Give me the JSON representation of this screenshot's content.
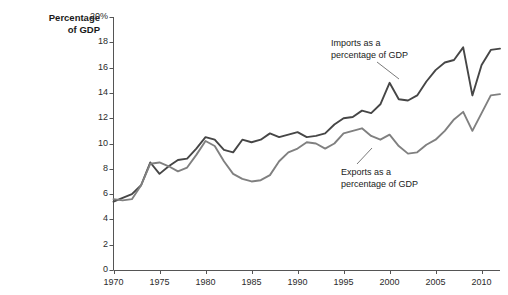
{
  "chart_data": {
    "type": "line",
    "title": "",
    "ylabel": "Percentage of GDP",
    "xlabel": "",
    "ylabel_line1": "Percentage",
    "ylabel_line2": "of GDP",
    "xlim": [
      1970,
      2012
    ],
    "ylim": [
      0,
      20
    ],
    "grid": false,
    "legend_position": "inline-annotations",
    "ytick_labels": [
      "20%",
      "18",
      "16",
      "14",
      "12",
      "10",
      "8",
      "6",
      "4",
      "2",
      "0"
    ],
    "ytick_values": [
      20,
      18,
      16,
      14,
      12,
      10,
      8,
      6,
      4,
      2,
      0
    ],
    "xtick_labels": [
      "1970",
      "1975",
      "1980",
      "1985",
      "1990",
      "1995",
      "2000",
      "2005",
      "2010"
    ],
    "xtick_values": [
      1970,
      1975,
      1980,
      1985,
      1990,
      1995,
      2000,
      2005,
      2010
    ],
    "x": [
      1970,
      1971,
      1972,
      1973,
      1974,
      1975,
      1976,
      1977,
      1978,
      1979,
      1980,
      1981,
      1982,
      1983,
      1984,
      1985,
      1986,
      1987,
      1988,
      1989,
      1990,
      1991,
      1992,
      1993,
      1994,
      1995,
      1996,
      1997,
      1998,
      1999,
      2000,
      2001,
      2002,
      2003,
      2004,
      2005,
      2006,
      2007,
      2008,
      2009,
      2010,
      2011,
      2012
    ],
    "series": [
      {
        "name": "Imports as a percentage of GDP",
        "color": "#464646",
        "annotation": "Imports as a\npercentage of GDP",
        "annotation_line1": "Imports as a",
        "annotation_line2": "percentage of GDP",
        "values": [
          5.4,
          5.7,
          6.0,
          6.7,
          8.5,
          7.6,
          8.2,
          8.7,
          8.8,
          9.6,
          10.5,
          10.3,
          9.5,
          9.3,
          10.3,
          10.1,
          10.3,
          10.8,
          10.5,
          10.7,
          10.9,
          10.5,
          10.6,
          10.8,
          11.5,
          12.0,
          12.1,
          12.6,
          12.4,
          13.1,
          14.8,
          13.5,
          13.4,
          13.8,
          14.9,
          15.8,
          16.4,
          16.6,
          17.6,
          13.8,
          16.2,
          17.4,
          17.5
        ]
      },
      {
        "name": "Exports as a percentage of GDP",
        "color": "#808080",
        "annotation": "Exports as a\npercentage of GDP",
        "annotation_line1": "Exports as a",
        "annotation_line2": "percentage of GDP",
        "values": [
          5.6,
          5.5,
          5.6,
          6.7,
          8.4,
          8.5,
          8.2,
          7.8,
          8.1,
          9.1,
          10.2,
          9.8,
          8.6,
          7.6,
          7.2,
          7.0,
          7.1,
          7.5,
          8.6,
          9.3,
          9.6,
          10.1,
          10.0,
          9.6,
          10.0,
          10.8,
          11.0,
          11.2,
          10.6,
          10.3,
          10.7,
          9.8,
          9.2,
          9.3,
          9.9,
          10.3,
          11.0,
          11.9,
          12.5,
          11.0,
          12.4,
          13.8,
          13.9
        ]
      }
    ]
  }
}
